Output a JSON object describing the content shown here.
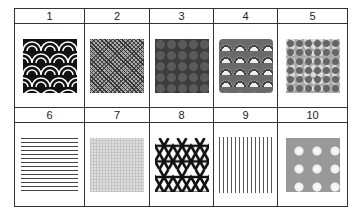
{
  "table": {
    "rows": [
      {
        "headers": [
          "1",
          "2",
          "3",
          "4",
          "5"
        ],
        "patterns": [
          {
            "name": "seigaiha-wave-pattern",
            "color": "#111111"
          },
          {
            "name": "fine-dotted-pattern",
            "color": "#999999"
          },
          {
            "name": "dark-circle-pattern",
            "color": "#3c3c3c"
          },
          {
            "name": "fan-wave-pattern",
            "color": "#6a6a6a"
          },
          {
            "name": "floral-mosaic-pattern",
            "color": "#aaaaaa"
          }
        ]
      },
      {
        "headers": [
          "6",
          "7",
          "8",
          "9",
          "10"
        ],
        "patterns": [
          {
            "name": "horizontal-lines-pattern",
            "color": "#444444"
          },
          {
            "name": "light-texture-pattern",
            "color": "#dddddd"
          },
          {
            "name": "kagome-lattice-pattern",
            "color": "#111111"
          },
          {
            "name": "vertical-lines-pattern",
            "color": "#555555"
          },
          {
            "name": "sakura-dot-pattern",
            "color": "#999999"
          }
        ]
      }
    ]
  }
}
